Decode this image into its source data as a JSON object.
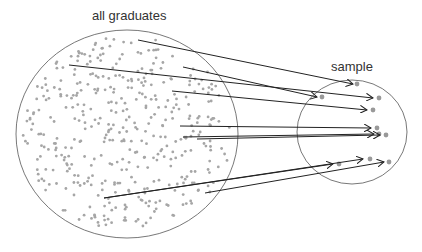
{
  "labels": {
    "population": "all graduates",
    "sample": "sample"
  },
  "colors": {
    "dot": "#a6a6a6",
    "line": "#222222",
    "outline": "#555555"
  },
  "population_circle": {
    "cx": 127,
    "cy": 134,
    "rx": 111,
    "ry": 104
  },
  "sample_circle": {
    "cx": 352,
    "cy": 132,
    "rx": 55,
    "ry": 52
  },
  "arrows": [
    {
      "x1": 138,
      "y1": 40,
      "x2": 353,
      "y2": 84
    },
    {
      "x1": 69,
      "y1": 65,
      "x2": 373,
      "y2": 98
    },
    {
      "x1": 183,
      "y1": 67,
      "x2": 317,
      "y2": 97
    },
    {
      "x1": 172,
      "y1": 91,
      "x2": 367,
      "y2": 110
    },
    {
      "x1": 180,
      "y1": 126,
      "x2": 371,
      "y2": 128
    },
    {
      "x1": 183,
      "y1": 137,
      "x2": 374,
      "y2": 134
    },
    {
      "x1": 197,
      "y1": 139,
      "x2": 380,
      "y2": 135
    },
    {
      "x1": 104,
      "y1": 198,
      "x2": 333,
      "y2": 164
    },
    {
      "x1": 205,
      "y1": 193,
      "x2": 384,
      "y2": 162
    },
    {
      "x1": 104,
      "y1": 198,
      "x2": 363,
      "y2": 159
    }
  ],
  "sample_dots": [
    [
      357,
      84
    ],
    [
      379,
      98
    ],
    [
      322,
      97
    ],
    [
      373,
      110
    ],
    [
      377,
      128
    ],
    [
      379,
      134
    ],
    [
      386,
      135
    ],
    [
      339,
      164
    ],
    [
      370,
      159
    ],
    [
      389,
      162
    ]
  ]
}
